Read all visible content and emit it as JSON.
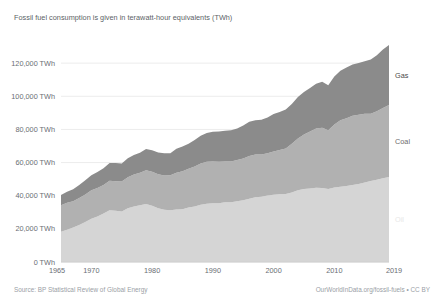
{
  "subtitle": "Fossil fuel consumption is given in terawatt-hour equivalents (TWh)",
  "footer": {
    "source": "Source: BP Statistical Review of Global Energy",
    "attribution": "OurWorldInData.org/fossil-fuels • CC BY"
  },
  "series_labels": {
    "gas": "Gas",
    "coal": "Coal",
    "oil": "Oil"
  },
  "colors": {
    "oil": "#d5d5d5",
    "coal": "#b1b1b1",
    "gas": "#8b8b8b",
    "gridline": "#ececec",
    "axis_text": "#6a6e74",
    "subtitle_text": "#5b5f66",
    "footer_text": "#9aa0a6",
    "gas_label": "#4a4a4a",
    "coal_label": "#6d6d6d",
    "oil_label": "#e8e8e8"
  },
  "chart_data": {
    "type": "area",
    "stacked": true,
    "title": "",
    "subtitle": "Fossil fuel consumption is given in terawatt-hour equivalents (TWh)",
    "xlabel": "",
    "ylabel": "",
    "xlim": [
      1965,
      2019
    ],
    "ylim": [
      0,
      140000
    ],
    "grid": true,
    "legend_position": "right-inline",
    "y_ticks": [
      0,
      20000,
      40000,
      60000,
      80000,
      100000,
      120000
    ],
    "y_tick_labels": [
      "0 TWh",
      "20,000 TWh",
      "40,000 TWh",
      "60,000 TWh",
      "80,000 TWh",
      "100,000 TWh",
      "120,000 TWh"
    ],
    "x_ticks": [
      1965,
      1970,
      1980,
      1990,
      2000,
      2010,
      2019
    ],
    "x_tick_labels": [
      "1965",
      "1970",
      "1980",
      "1990",
      "2000",
      "2010",
      "2019"
    ],
    "x": [
      1965,
      1966,
      1967,
      1968,
      1969,
      1970,
      1971,
      1972,
      1973,
      1974,
      1975,
      1976,
      1977,
      1978,
      1979,
      1980,
      1981,
      1982,
      1983,
      1984,
      1985,
      1986,
      1987,
      1988,
      1989,
      1990,
      1991,
      1992,
      1993,
      1994,
      1995,
      1996,
      1997,
      1998,
      1999,
      2000,
      2001,
      2002,
      2003,
      2004,
      2005,
      2006,
      2007,
      2008,
      2009,
      2010,
      2011,
      2012,
      2013,
      2014,
      2015,
      2016,
      2017,
      2018,
      2019
    ],
    "series": [
      {
        "name": "Oil",
        "color": "#d5d5d5",
        "values": [
          18200,
          19500,
          20800,
          22400,
          24100,
          26100,
          27500,
          29200,
          31300,
          30900,
          30500,
          32400,
          33500,
          34300,
          35000,
          33900,
          32500,
          31600,
          31200,
          31700,
          31800,
          32900,
          33500,
          34500,
          35100,
          35400,
          35500,
          36000,
          36000,
          36700,
          37200,
          38100,
          39000,
          39300,
          40200,
          40600,
          40900,
          41100,
          41900,
          43300,
          44000,
          44400,
          44800,
          44700,
          44000,
          45000,
          45400,
          45900,
          46500,
          47000,
          48000,
          48900,
          49700,
          50600,
          51300
        ]
      },
      {
        "name": "Coal",
        "color": "#b1b1b1",
        "values": [
          16100,
          16200,
          15900,
          16200,
          16700,
          17200,
          17100,
          17200,
          17800,
          17900,
          18100,
          18800,
          19300,
          19500,
          20300,
          20500,
          20400,
          20600,
          21100,
          22200,
          23000,
          23400,
          24200,
          25000,
          25400,
          25300,
          25000,
          24700,
          24600,
          24800,
          25300,
          25800,
          25900,
          25600,
          25400,
          26100,
          26700,
          27400,
          29400,
          31300,
          33000,
          34400,
          35700,
          36300,
          35500,
          38000,
          40200,
          40900,
          41700,
          41900,
          41400,
          40600,
          41200,
          42300,
          43400
        ]
      },
      {
        "name": "Gas",
        "color": "#8b8b8b",
        "values": [
          6200,
          6700,
          7200,
          7800,
          8500,
          9100,
          9700,
          10200,
          10600,
          10900,
          10900,
          11400,
          11700,
          12200,
          12900,
          13100,
          13200,
          13400,
          13400,
          14400,
          14900,
          15100,
          15900,
          16700,
          17400,
          17900,
          18300,
          18500,
          18900,
          19100,
          19900,
          20700,
          20700,
          21000,
          21600,
          22600,
          22900,
          23500,
          24100,
          24900,
          25600,
          26200,
          27000,
          27700,
          27100,
          29000,
          29800,
          30500,
          31000,
          31200,
          31700,
          32700,
          33800,
          35400,
          36300
        ]
      }
    ],
    "series_end_values_2019": {
      "Oil": 51300,
      "Coal": 43400,
      "Gas": 36300,
      "Total": 131000
    }
  }
}
